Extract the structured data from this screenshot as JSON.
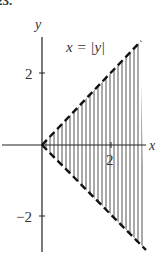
{
  "header_fragment": "23.",
  "figure": {
    "equation_label": "x = |y|",
    "axis_x_label": "x",
    "axis_y_label": "y",
    "ticks": {
      "x": [
        "2"
      ],
      "y": [
        "2",
        "−2"
      ]
    },
    "region": {
      "description": "Shaded region right of x = |y|, bounded by dashed lines y = x and y = -x",
      "boundary_style": "dashed",
      "fill_style": "vertical-hatch"
    },
    "colors": {
      "ink": "#222222",
      "hatch": "#555555",
      "background": "#ffffff"
    }
  }
}
